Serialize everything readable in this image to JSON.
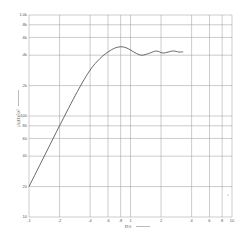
{
  "chart_data": {
    "type": "line",
    "title": "",
    "xlabel": "D/λ →",
    "ylabel": "|A(D)|²/λ² →",
    "xscale": "log",
    "yscale": "log",
    "xlim": [
      0.1,
      10
    ],
    "ylim": [
      10,
      1000
    ],
    "grid": true,
    "legend": null,
    "x_ticks": [
      0.1,
      0.2,
      0.4,
      0.6,
      0.8,
      1,
      2,
      4,
      6,
      8,
      10
    ],
    "x_tick_labels": [
      ".1",
      ".2",
      ".4",
      ".6",
      ".8",
      "1",
      "2",
      "4",
      "6",
      "8",
      "10"
    ],
    "y_ticks": [
      10,
      20,
      40,
      60,
      80,
      100,
      200,
      400,
      600,
      800,
      1000
    ],
    "y_tick_labels": [
      "10",
      "20",
      "40",
      "60",
      "80",
      "100",
      ".2k",
      ".4k",
      ".6k",
      ".8k",
      "1.0k"
    ],
    "series": [
      {
        "name": "curve",
        "x": [
          0.1,
          0.15,
          0.2,
          0.3,
          0.4,
          0.5,
          0.6,
          0.7,
          0.8,
          0.9,
          1.0,
          1.15,
          1.3,
          1.5,
          1.8,
          2.1,
          2.6,
          3.0,
          3.3
        ],
        "y": [
          20,
          45,
          80,
          175,
          285,
          370,
          430,
          470,
          485,
          475,
          450,
          415,
          400,
          415,
          440,
          420,
          440,
          430,
          432
        ]
      }
    ]
  },
  "labels": {
    "xlabel": "D/λ",
    "ylabel": "|A(D)|²/λ²"
  }
}
